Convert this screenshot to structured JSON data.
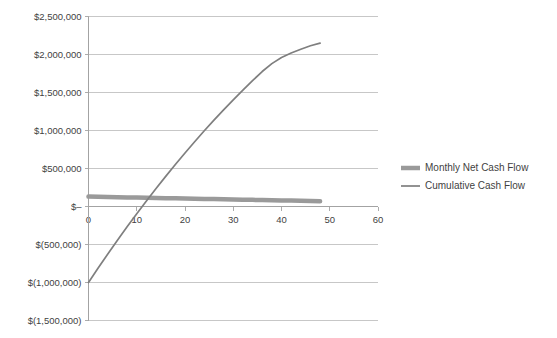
{
  "chart_data": {
    "type": "line",
    "title": "",
    "subtitle": "",
    "xlabel": "",
    "ylabel": "",
    "grid": true,
    "legend_position": "right",
    "xlim": [
      0,
      60
    ],
    "ylim": [
      -1500000,
      2500000
    ],
    "xticks": [
      0,
      10,
      20,
      30,
      40,
      50,
      60
    ],
    "xtick_labels": [
      "0",
      "10",
      "20",
      "30",
      "40",
      "50",
      "60"
    ],
    "yticks": [
      -1500000,
      -1000000,
      -500000,
      0,
      500000,
      1000000,
      1500000,
      2000000,
      2500000
    ],
    "ytick_labels": [
      "$(1,500,000)",
      "$(1,000,000)",
      "$(500,000)",
      "$–",
      "$500,000",
      "$1,000,000",
      "$1,500,000",
      "$2,000,000",
      "$2,500,000"
    ],
    "x": [
      0,
      2,
      4,
      6,
      8,
      10,
      12,
      14,
      16,
      18,
      20,
      22,
      24,
      26,
      28,
      30,
      32,
      34,
      36,
      38,
      40,
      42,
      44,
      46,
      48
    ],
    "series": [
      {
        "name": "Monthly Net Cash Flow",
        "color": "#9a9a9a",
        "width": 4.5,
        "values": [
          130000,
          127500,
          125000,
          122500,
          120000,
          117500,
          115000,
          112500,
          110000,
          107500,
          105000,
          102500,
          100000,
          97500,
          95000,
          92500,
          90000,
          87500,
          85000,
          82500,
          80000,
          77500,
          75000,
          72500,
          70000
        ]
      },
      {
        "name": "Cumulative Cash Flow",
        "color": "#7f7f7f",
        "width": 1.7,
        "values": [
          -1000000,
          -810000,
          -625000,
          -445000,
          -268000,
          -96000,
          72000,
          236000,
          396000,
          552000,
          704000,
          852000,
          996000,
          1136000,
          1272000,
          1404000,
          1532000,
          1656000,
          1776000,
          1880000,
          1960000,
          2020000,
          2070000,
          2115000,
          2150000
        ]
      }
    ],
    "legend": [
      {
        "label": "Monthly Net Cash Flow",
        "color": "#9a9a9a",
        "width": 4.5
      },
      {
        "label": "Cumulative Cash Flow",
        "color": "#7f7f7f",
        "width": 1.7
      }
    ]
  }
}
